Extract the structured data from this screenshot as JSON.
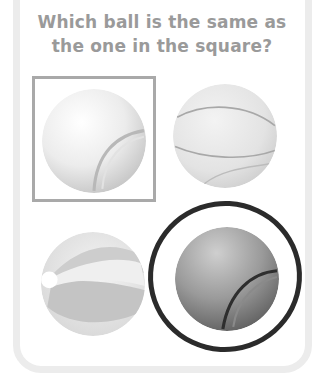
{
  "question": {
    "line1": "Which ball is the same as",
    "line2": "the one in the square?"
  },
  "options": [
    {
      "id": "tennis-ball-light",
      "icon": "tennis-ball-icon",
      "in_square": true,
      "circled": false
    },
    {
      "id": "basketball",
      "icon": "basketball-icon",
      "in_square": false,
      "circled": false
    },
    {
      "id": "beach-ball",
      "icon": "beach-ball-icon",
      "in_square": false,
      "circled": false
    },
    {
      "id": "tennis-ball-dark",
      "icon": "tennis-ball-icon",
      "in_square": false,
      "circled": true
    }
  ],
  "colors": {
    "title": "#9a9a9a",
    "frame": "#ececec",
    "square_border": "#a9a9a9",
    "answer_ring": "#2b2b2b"
  }
}
